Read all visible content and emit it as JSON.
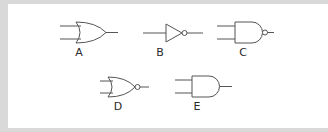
{
  "diagram": {
    "title": "",
    "background_color": "#d9d9d9",
    "panel_color": "#ffffff",
    "stroke_color": "#555555",
    "gates": [
      {
        "id": "A",
        "label": "A",
        "type": "OR"
      },
      {
        "id": "B",
        "label": "B",
        "type": "NOT"
      },
      {
        "id": "C",
        "label": "C",
        "type": "NAND"
      },
      {
        "id": "D",
        "label": "D",
        "type": "NOR"
      },
      {
        "id": "E",
        "label": "E",
        "type": "AND"
      }
    ]
  }
}
